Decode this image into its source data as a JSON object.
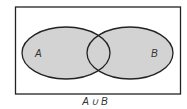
{
  "diagram": {
    "type": "venn",
    "universe": {
      "x": 15,
      "y": 7,
      "width": 165,
      "height": 87,
      "stroke": "#222222"
    },
    "sets": [
      {
        "label": "A",
        "cx": 66,
        "cy": 53,
        "rx": 44,
        "ry": 26,
        "fill": "#d3d3d3"
      },
      {
        "label": "B",
        "cx": 130,
        "cy": 53,
        "rx": 43,
        "ry": 26,
        "fill": "#d3d3d3"
      }
    ],
    "caption": "A ∪ B",
    "shaded_region": "union"
  }
}
